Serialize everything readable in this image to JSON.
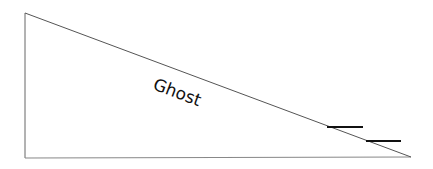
{
  "diagram": {
    "type": "right-triangle-incline",
    "label": "Ghost",
    "colors": {
      "background": "#ffffff",
      "outline": "#555555",
      "marks": "#111111",
      "text": "#111111"
    },
    "vertices": {
      "top_left": [
        25,
        13
      ],
      "bottom_left": [
        25,
        158
      ],
      "bottom_right": [
        411,
        157
      ]
    },
    "marks": [
      {
        "x1": 327,
        "y1": 127,
        "x2": 363,
        "y2": 127
      },
      {
        "x1": 366,
        "y1": 141,
        "x2": 401,
        "y2": 141
      }
    ],
    "label_position": {
      "x": 177,
      "y": 93,
      "rotation_deg": 20.5
    }
  }
}
